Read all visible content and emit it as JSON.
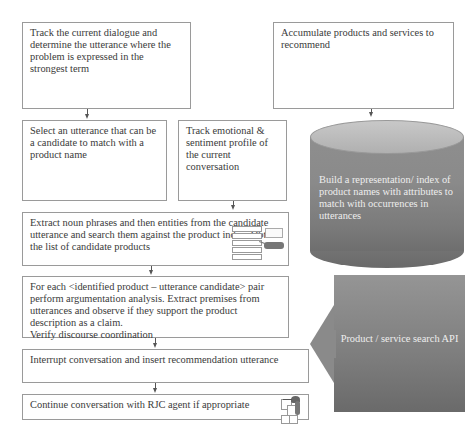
{
  "diagram": {
    "type": "flowchart",
    "left_column": {
      "step1": "Track the current dialogue and determine the utterance where the problem is expressed in the strongest term",
      "step2a": "Select an utterance that can be a candidate to match with a product name",
      "step2b": "Track emotional & sentiment profile of the current conversation",
      "step3": "Extract noun phrases and then entities from the candidate utterance and search them against the product index. Obtain the list of candidate products",
      "step4_lines": [
        "For each <identified product – utterance  candidate> pair perform argumentation analysis. Extract premises from utterances and observe if they support the product description as a claim.",
        "Verify discourse coordination"
      ],
      "step5": "Interrupt conversation and insert recommendation utterance",
      "step6": "Continue conversation with RJC agent if appropriate"
    },
    "right_column": {
      "accumulate": "Accumulate products and services to recommend",
      "index_cylinder": "Build a representation/ index of product names with attributes to match with occurrences in utterances",
      "api_arrow": "Product / service search API"
    },
    "icons": {
      "list_search": "list-search-icon",
      "agent": "agent-icon"
    },
    "colors": {
      "box_border": "#9a9a9a",
      "arrow": "#555555",
      "cylinder_top": "#c0c0c0",
      "cylinder_body": "#858585",
      "api_block": "#858585",
      "shape_text": "#eeeeee"
    }
  }
}
